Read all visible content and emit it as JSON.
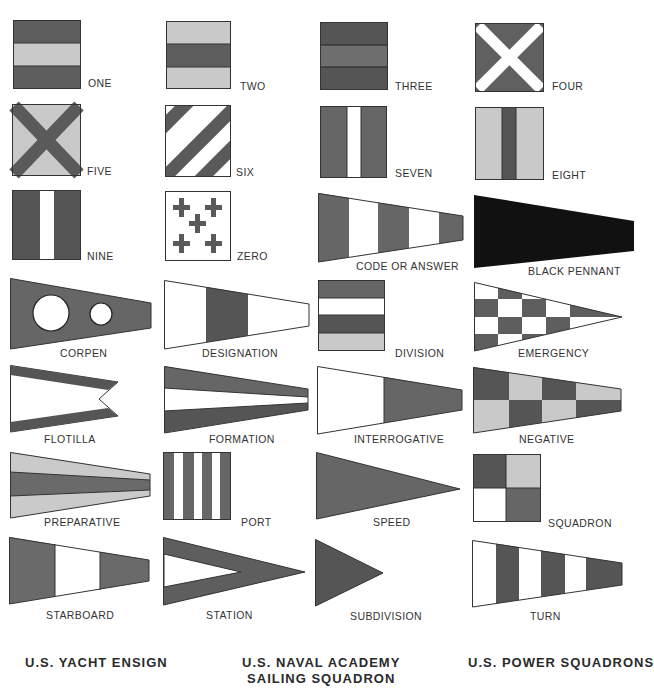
{
  "colors": {
    "dark": "#5a5a5a",
    "mid": "#707070",
    "light": "#c8c8c8",
    "white": "#ffffff",
    "black": "#111111",
    "outline": "#333333"
  },
  "flags": [
    {
      "id": "one",
      "label": "ONE",
      "shape": "square",
      "pattern": "horizontal stripes dark-light-dark"
    },
    {
      "id": "two",
      "label": "TWO",
      "shape": "square",
      "pattern": "horizontal stripes light-dark-light"
    },
    {
      "id": "three",
      "label": "THREE",
      "shape": "square",
      "pattern": "horizontal stripes dark-mid-dark"
    },
    {
      "id": "four",
      "label": "FOUR",
      "shape": "square",
      "pattern": "white saltire on dark"
    },
    {
      "id": "five",
      "label": "FIVE",
      "shape": "square",
      "pattern": "dark saltire on light"
    },
    {
      "id": "six",
      "label": "SIX",
      "shape": "square",
      "pattern": "diagonal stripes dark and white"
    },
    {
      "id": "seven",
      "label": "SEVEN",
      "shape": "square",
      "pattern": "vertical stripes dark-white-dark"
    },
    {
      "id": "eight",
      "label": "EIGHT",
      "shape": "square",
      "pattern": "vertical stripes light-dark-light"
    },
    {
      "id": "nine",
      "label": "NINE",
      "shape": "square",
      "pattern": "vertical stripes dark-white-dark"
    },
    {
      "id": "zero",
      "label": "ZERO",
      "shape": "square",
      "pattern": "five dark crosses on white"
    },
    {
      "id": "code-or-answer",
      "label": "CODE OR ANSWER",
      "shape": "pennant",
      "pattern": "vertical bands dark-white-dark-white-dark"
    },
    {
      "id": "black-pennant",
      "label": "BLACK PENNANT",
      "shape": "pennant",
      "pattern": "solid black"
    },
    {
      "id": "corpen",
      "label": "CORPEN",
      "shape": "pennant",
      "pattern": "dark with two white circles"
    },
    {
      "id": "designation",
      "label": "DESIGNATION",
      "shape": "pennant",
      "pattern": "vertical bands white-dark-white"
    },
    {
      "id": "division",
      "label": "DIVISION",
      "shape": "square",
      "pattern": "horizontal stripes dark-white-dark-light"
    },
    {
      "id": "emergency",
      "label": "EMERGENCY",
      "shape": "triangle",
      "pattern": "checkered dark and white"
    },
    {
      "id": "flotilla",
      "label": "FLOTILLA",
      "shape": "swallowtail",
      "pattern": "white with dark border top and bottom"
    },
    {
      "id": "formation",
      "label": "FORMATION",
      "shape": "pennant",
      "pattern": "horizontal stripes dark-white-dark"
    },
    {
      "id": "interrogative",
      "label": "INTERROGATIVE",
      "shape": "pennant",
      "pattern": "white hoist, dark fly"
    },
    {
      "id": "negative",
      "label": "NEGATIVE",
      "shape": "pennant",
      "pattern": "checkered dark and light, 2 rows x 4"
    },
    {
      "id": "preparative",
      "label": "PREPARATIVE",
      "shape": "pennant",
      "pattern": "horizontal stripes light-dark-light"
    },
    {
      "id": "port",
      "label": "PORT",
      "shape": "square",
      "pattern": "vertical stripes dark and white"
    },
    {
      "id": "speed",
      "label": "SPEED",
      "shape": "triangle",
      "pattern": "solid dark"
    },
    {
      "id": "squadron",
      "label": "SQUADRON",
      "shape": "square",
      "pattern": "quartered dark-light / white-mid"
    },
    {
      "id": "starboard",
      "label": "STARBOARD",
      "shape": "pennant",
      "pattern": "vertical bands dark-white-dark"
    },
    {
      "id": "station",
      "label": "STATION",
      "shape": "triangle",
      "pattern": "dark with white inner triangle"
    },
    {
      "id": "subdivision",
      "label": "SUBDIVISION",
      "shape": "triangle",
      "pattern": "solid dark"
    },
    {
      "id": "turn",
      "label": "TURN",
      "shape": "pennant",
      "pattern": "vertical bands white-dark alternating, 6 bands"
    }
  ],
  "headings": {
    "yacht": "U.S. YACHT ENSIGN",
    "naval_line1": "U.S. NAVAL ACADEMY",
    "naval_line2": "SAILING SQUADRON",
    "power": "U.S. POWER SQUADRONS"
  }
}
